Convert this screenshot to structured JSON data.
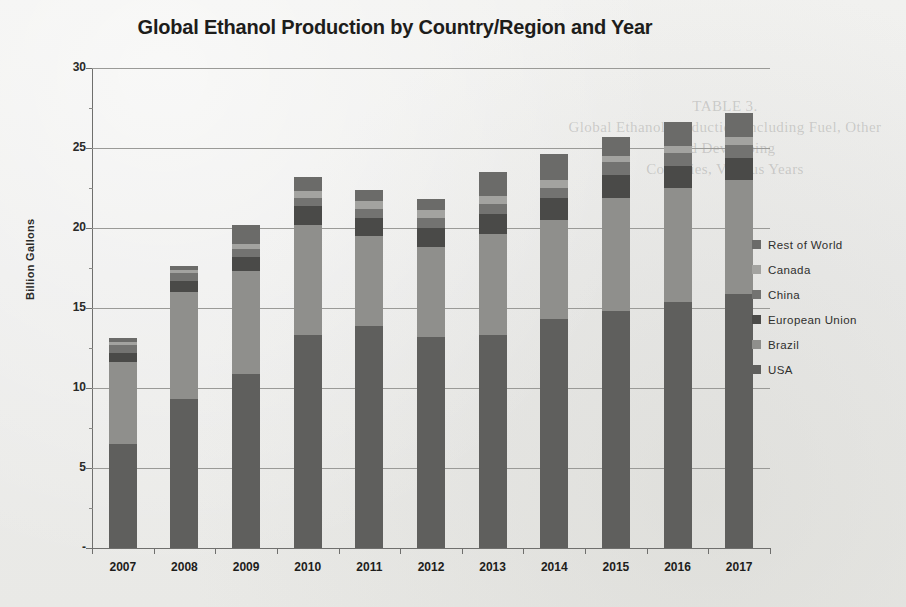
{
  "chart_data": {
    "type": "bar",
    "stacked": true,
    "title": "Global Ethanol Production by Country/Region and Year",
    "xlabel": "",
    "ylabel": "Billion Gallons",
    "categories": [
      "2007",
      "2008",
      "2009",
      "2010",
      "2011",
      "2012",
      "2013",
      "2014",
      "2015",
      "2016",
      "2017"
    ],
    "ylim": [
      0,
      30
    ],
    "yticks": [
      "-",
      "5",
      "10",
      "15",
      "20",
      "25",
      "30"
    ],
    "ytick_values": [
      0,
      5,
      10,
      15,
      20,
      25,
      30
    ],
    "grid": true,
    "legend_position": "right",
    "series": [
      {
        "name": "USA",
        "color": "#5f5f5d",
        "values": [
          6.5,
          9.3,
          10.9,
          13.3,
          13.9,
          13.2,
          13.3,
          14.3,
          14.8,
          15.4,
          15.9
        ]
      },
      {
        "name": "Brazil",
        "color": "#8f8f8c",
        "values": [
          5.1,
          6.7,
          6.4,
          6.9,
          5.6,
          5.6,
          6.3,
          6.2,
          7.1,
          7.1,
          7.1
        ]
      },
      {
        "name": "European Union",
        "color": "#4a4a48",
        "values": [
          0.6,
          0.7,
          0.9,
          1.2,
          1.1,
          1.2,
          1.3,
          1.4,
          1.4,
          1.4,
          1.4
        ]
      },
      {
        "name": "China",
        "color": "#737371",
        "values": [
          0.5,
          0.5,
          0.5,
          0.5,
          0.6,
          0.6,
          0.6,
          0.6,
          0.8,
          0.8,
          0.8
        ]
      },
      {
        "name": "Canada",
        "color": "#a3a3a0",
        "values": [
          0.2,
          0.2,
          0.3,
          0.4,
          0.5,
          0.5,
          0.5,
          0.5,
          0.4,
          0.4,
          0.5
        ]
      },
      {
        "name": "Rest of World",
        "color": "#6b6b69",
        "values": [
          0.2,
          0.2,
          1.2,
          0.9,
          0.7,
          0.7,
          1.5,
          1.6,
          1.2,
          1.5,
          1.5
        ]
      }
    ],
    "totals": [
      13.1,
      17.6,
      20.2,
      23.2,
      22.4,
      21.8,
      23.5,
      24.6,
      25.7,
      26.6,
      27.2
    ],
    "legend_order": [
      "Rest of World",
      "Canada",
      "China",
      "European Union",
      "Brazil",
      "USA"
    ]
  },
  "background_text": {
    "ghost_heading": "TABLE 3.",
    "ghost_line1": "Global Ethanol Production Including Fuel, Other and Developing",
    "ghost_line2": "Countries, Various Years",
    "ghost_footer": ""
  }
}
